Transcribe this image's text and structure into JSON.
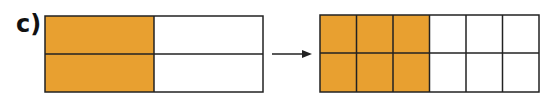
{
  "label": "c)",
  "colors": {
    "shaded": "#E8A030",
    "empty": "#ffffff",
    "stroke": "#222222"
  },
  "left_model": {
    "rows": 2,
    "cols": 2,
    "shaded_cols": 1,
    "fraction": "2/4"
  },
  "right_model": {
    "rows": 2,
    "cols": 6,
    "shaded_cols": 3,
    "fraction": "6/12"
  },
  "arrow": "right-arrow"
}
